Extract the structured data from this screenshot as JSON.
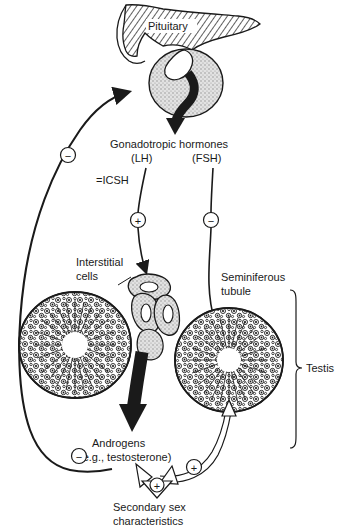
{
  "figure": {
    "background_color": "#ffffff",
    "ink_color": "#1a1a1a",
    "gland_fill": "#d4d4d4"
  },
  "labels": {
    "pituitary": "Pituitary",
    "gonadotropic_hormones": "Gonadotropic hormones",
    "lh": "(LH)",
    "fsh": "(FSH)",
    "icsh": "=ICSH",
    "interstitial_cells_line1": "Interstitial",
    "interstitial_cells_line2": "cells",
    "seminiferous_line1": "Seminiferous",
    "seminiferous_line2": "tubule",
    "testis": "Testis",
    "androgens": "Androgens",
    "androgens_example": "(e.g., testosterone)",
    "secondary_line1": "Secondary sex",
    "secondary_line2": "characteristics"
  },
  "signs": {
    "feedback_left_top": "−",
    "lh_to_interstitial": "+",
    "fsh_to_tubule": "−",
    "androgen_feedback_left": "−",
    "androgen_feedback_right": "+",
    "secondary_sex_effect": "+"
  },
  "structures": [
    {
      "name": "hypothalamus-hatched-region",
      "kind": "hatched-tissue"
    },
    {
      "name": "pituitary-gland",
      "kind": "stippled-oval"
    },
    {
      "name": "interstitial-cell-cluster",
      "kind": "stippled-cells"
    },
    {
      "name": "left-seminiferous-tubule",
      "kind": "tubule-cross-section"
    },
    {
      "name": "right-seminiferous-tubule",
      "kind": "tubule-cross-section"
    }
  ],
  "arrows": [
    {
      "name": "pituitary-secretion-arrow",
      "style": "solid-black-curved"
    },
    {
      "name": "lh-pathway-arrow",
      "style": "thin-line-arrow"
    },
    {
      "name": "fsh-pathway-arrow",
      "style": "thin-line-arrow"
    },
    {
      "name": "androgen-production-arrow",
      "style": "thick-black"
    },
    {
      "name": "androgen-negative-feedback-arrow",
      "style": "thin-curve-arrow"
    },
    {
      "name": "androgen-positive-feedback-arrow",
      "style": "outline-curve-arrow"
    },
    {
      "name": "secondary-sex-arrow",
      "style": "outline-arrow"
    }
  ]
}
